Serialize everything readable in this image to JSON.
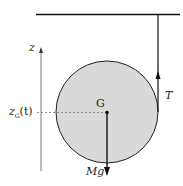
{
  "diagram": {
    "labels": {
      "axis": "z",
      "position": "z",
      "position_sub": "G",
      "position_arg": "(t)",
      "center": "G",
      "tension": "T",
      "weight": "Mg"
    },
    "colors": {
      "disk_fill": "#d9d9d9",
      "stroke": "#111111"
    }
  }
}
